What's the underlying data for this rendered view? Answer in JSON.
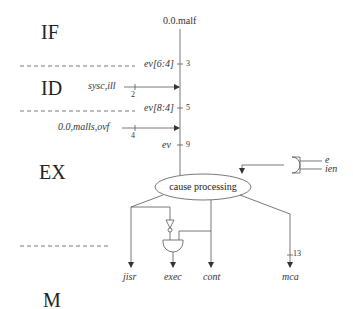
{
  "stages": [
    "IF",
    "ID",
    "EX",
    "M"
  ],
  "top_signal": "0.0.malf",
  "inputs": [
    {
      "label": "ev[6:4]",
      "tick": "3"
    },
    {
      "label": "sysc,ill",
      "tick": "2"
    },
    {
      "label": "ev[8:4]",
      "tick": "5"
    },
    {
      "label": "0.0,malls,ovf",
      "tick": "4"
    },
    {
      "label": "ev",
      "tick": "9"
    }
  ],
  "gate_inputs": [
    "e",
    "ien"
  ],
  "block": "cause processing",
  "outputs": [
    "jisr",
    "exec",
    "cont",
    "mca"
  ],
  "mca_tick": "13"
}
